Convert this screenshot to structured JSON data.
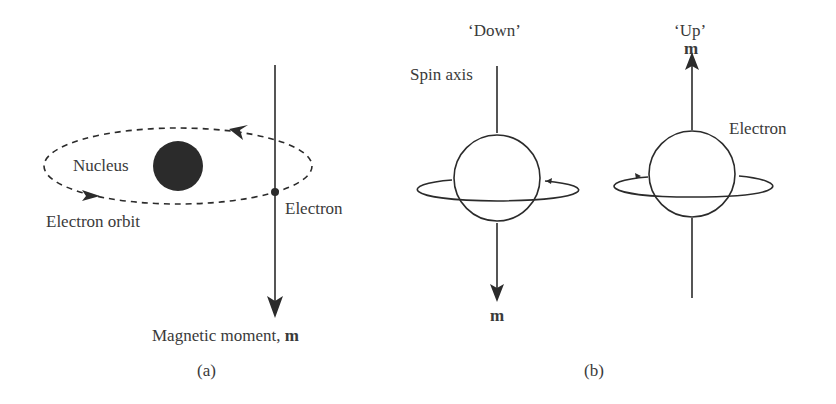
{
  "panel_a": {
    "caption": "(a)",
    "nucleus_label": "Nucleus",
    "orbit_label": "Electron orbit",
    "electron_label": "Electron",
    "moment_label": "Magnetic moment, ",
    "moment_symbol": "m"
  },
  "panel_b": {
    "caption": "(b)",
    "down": {
      "title": "‘Down’",
      "axis_label": "Spin axis",
      "moment_symbol": "m"
    },
    "up": {
      "title": "‘Up’",
      "electron_label": "Electron",
      "moment_symbol": "m"
    }
  },
  "colors": {
    "ink": "#2b2b2b",
    "text": "#3a3a3a"
  }
}
